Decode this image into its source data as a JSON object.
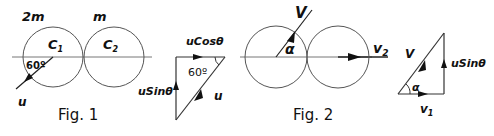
{
  "figure1": {
    "caption": "Fig. 1",
    "mass_left": "2m",
    "mass_right": "m",
    "circle_left_label": "C",
    "circle_left_sub": "1",
    "circle_right_label": "C",
    "circle_right_sub": "2",
    "angle_label": "60º",
    "velocity_label": "u"
  },
  "figure1_triangle": {
    "top_label": "uCosθ",
    "left_label": "uSinθ",
    "angle_label": "60º",
    "hypotenuse_label": "u"
  },
  "figure2": {
    "caption": "Fig. 2",
    "velocity_label": "V",
    "angle_label": "α",
    "v2_label": "v",
    "v2_sub": "2"
  },
  "figure2_triangle": {
    "hypotenuse_label": "V",
    "angle_label": "α",
    "right_label": "uSinθ",
    "bottom_label": "v",
    "bottom_sub": "1"
  },
  "colors": {
    "stroke": "#555555",
    "ink": "#111111",
    "background": "#ffffff"
  }
}
